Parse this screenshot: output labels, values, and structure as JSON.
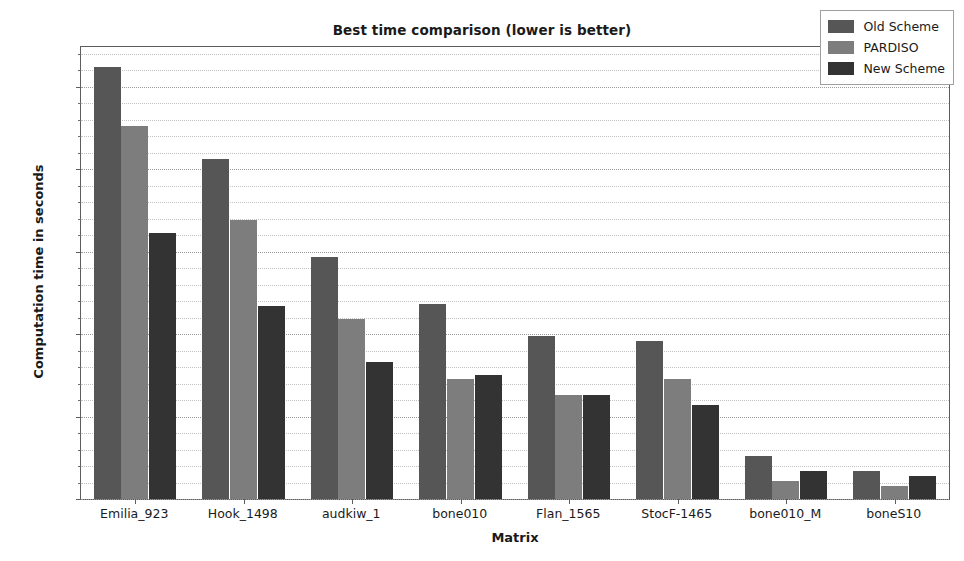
{
  "chart_data": {
    "type": "bar",
    "title": "Best time comparison (lower is better)",
    "xlabel": "Matrix",
    "ylabel": "Computation time in seconds",
    "categories": [
      "Emilia_923",
      "Hook_1498",
      "audkiw_1",
      "bone010",
      "Flan_1565",
      "StocF-1465",
      "bone010_M",
      "boneS10"
    ],
    "series": [
      {
        "name": "Old Scheme",
        "color": "#565656",
        "values": [
          26.2,
          20.6,
          14.7,
          11.8,
          9.9,
          9.6,
          2.6,
          1.7
        ]
      },
      {
        "name": "PARDISO",
        "color": "#7d7d7d",
        "values": [
          22.6,
          16.9,
          10.9,
          7.3,
          6.3,
          7.3,
          1.1,
          0.8
        ]
      },
      {
        "name": "New Scheme",
        "color": "#333333",
        "values": [
          16.1,
          11.7,
          8.3,
          7.5,
          6.3,
          5.7,
          1.7,
          1.4
        ]
      }
    ],
    "ylim": [
      0,
      27.4
    ],
    "ytick_labels": [
      "0",
      "5",
      "10",
      "15",
      "20",
      "25"
    ],
    "ytick_values": [
      0,
      5,
      10,
      15,
      20,
      25
    ],
    "yminor_step": 1,
    "grid": true,
    "legend_position": "upper right"
  }
}
